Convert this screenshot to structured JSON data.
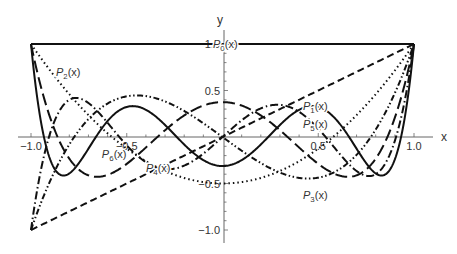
{
  "chart_data": {
    "type": "line",
    "title": "",
    "xlabel": "x",
    "ylabel": "y",
    "xlim": [
      -1.0,
      1.0
    ],
    "ylim": [
      -1.0,
      1.0
    ],
    "grid": false,
    "x_ticks": [
      "-1.0",
      "-0.5",
      "0.5",
      "1.0"
    ],
    "y_ticks": [
      "-1.0",
      "-0.5",
      "0.5",
      "1.0"
    ],
    "series": [
      {
        "name": "P0(x)",
        "label_sub": "0",
        "style": "solid",
        "formula": "1",
        "x": [
          -1,
          -0.5,
          0,
          0.5,
          1
        ],
        "values": [
          1,
          1,
          1,
          1,
          1
        ]
      },
      {
        "name": "P1(x)",
        "label_sub": "1",
        "style": "dashed",
        "formula": "x",
        "x": [
          -1,
          -0.5,
          0,
          0.5,
          1
        ],
        "values": [
          -1,
          -0.5,
          0,
          0.5,
          1
        ]
      },
      {
        "name": "P2(x)",
        "label_sub": "2",
        "style": "dotted",
        "formula": "(3x^2-1)/2",
        "x": [
          -1,
          -0.5,
          0,
          0.5,
          1
        ],
        "values": [
          1,
          -0.125,
          -0.5,
          -0.125,
          1
        ]
      },
      {
        "name": "P3(x)",
        "label_sub": "3",
        "style": "dash-dot-dot",
        "formula": "(5x^3-3x)/2",
        "x": [
          -1,
          -0.5,
          0,
          0.5,
          1
        ],
        "values": [
          -1,
          0.4375,
          0,
          -0.4375,
          1
        ]
      },
      {
        "name": "P4(x)",
        "label_sub": "4",
        "style": "long-dash",
        "formula": "(35x^4-30x^2+3)/8",
        "x": [
          -1,
          -0.5,
          0,
          0.5,
          1
        ],
        "values": [
          1,
          -0.289,
          0.375,
          -0.289,
          1
        ]
      },
      {
        "name": "P5(x)",
        "label_sub": "5",
        "style": "dash-dot",
        "formula": "(63x^5-70x^3+15x)/8",
        "x": [
          -1,
          -0.5,
          0,
          0.5,
          1
        ],
        "values": [
          -1,
          -0.0898,
          0,
          0.0898,
          1
        ]
      },
      {
        "name": "P6(x)",
        "label_sub": "6",
        "style": "solid-thick",
        "formula": "(231x^6-315x^4+105x^2-5)/16",
        "x": [
          -1,
          -0.5,
          0,
          0.5,
          1
        ],
        "values": [
          1,
          0.3232,
          -0.3125,
          0.3232,
          1
        ]
      }
    ],
    "annotations": [
      {
        "text": "P0(x)",
        "x": -0.05,
        "y": 1.0
      },
      {
        "text": "P1(x)",
        "x": 0.42,
        "y": 0.33
      },
      {
        "text": "P2(x)",
        "x": -0.87,
        "y": 0.7
      },
      {
        "text": "P3(x)",
        "x": 0.42,
        "y": -0.62
      },
      {
        "text": "P4(x)",
        "x": -0.4,
        "y": -0.33
      },
      {
        "text": "P5(x)",
        "x": 0.42,
        "y": 0.14
      },
      {
        "text": "P6(x)",
        "x": -0.63,
        "y": -0.18
      }
    ]
  },
  "labels": {
    "x_axis": "x",
    "y_axis": "y",
    "p": "P",
    "x_suffix": "(x)"
  }
}
